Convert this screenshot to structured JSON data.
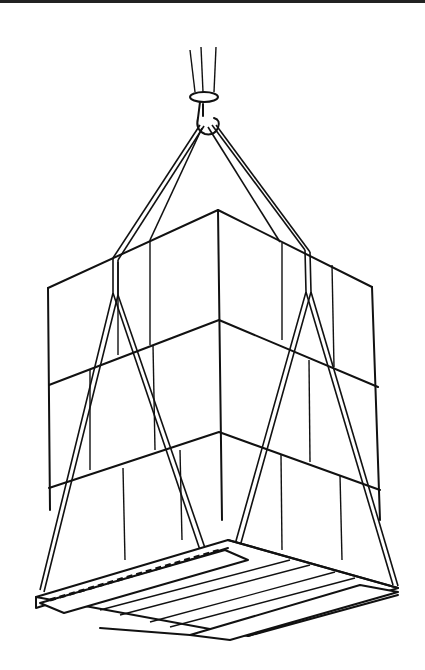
{
  "illustration": {
    "subject": "Crane hook lifting a sling-wrapped pallet load of boxes",
    "style": "black-and-white line drawing",
    "colors": {
      "ink": "#111111",
      "paper": "#ffffff"
    }
  }
}
